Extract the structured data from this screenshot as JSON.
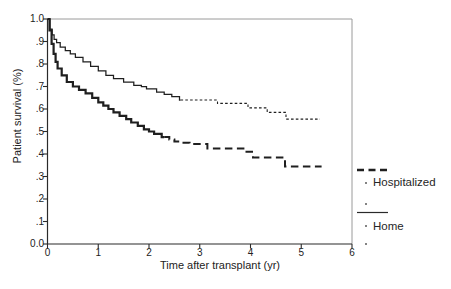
{
  "figure": {
    "background": "#ffffff",
    "ink_color": "#1f1f1f",
    "frame_color": "#9a9a9a",
    "axis_color": "#2a2a2a"
  },
  "chart_data": {
    "type": "line",
    "subtype": "kaplan-meier-step-survival",
    "title": "",
    "xlabel": "Time after transplant (yr)",
    "ylabel": "Patient survival (%)",
    "xlim": [
      0,
      6
    ],
    "ylim": [
      0,
      1
    ],
    "grid": false,
    "legend_position": "right-outside",
    "x_ticks": [
      0,
      1,
      2,
      3,
      4,
      5,
      6
    ],
    "x_tick_labels": [
      "0",
      "1",
      "2",
      "3",
      "4",
      "5",
      "6"
    ],
    "y_ticks": [
      1.0,
      0.9,
      0.8,
      0.7,
      0.6,
      0.5,
      0.4,
      0.3,
      0.2,
      0.1,
      0.0
    ],
    "y_tick_labels": [
      "1.0",
      ".9",
      ".8",
      ".7",
      ".6",
      ".5",
      ".4",
      ".3",
      ".2",
      ".1",
      "0.0"
    ],
    "series": [
      {
        "name": "Hospitalized",
        "line_style": "dashed",
        "points": [
          [
            0,
            1.0
          ],
          [
            0.04,
            0.95
          ],
          [
            0.08,
            0.89
          ],
          [
            0.12,
            0.845
          ],
          [
            0.16,
            0.81
          ],
          [
            0.2,
            0.78
          ],
          [
            0.28,
            0.75
          ],
          [
            0.38,
            0.72
          ],
          [
            0.5,
            0.7
          ],
          [
            0.62,
            0.685
          ],
          [
            0.75,
            0.67
          ],
          [
            0.88,
            0.65
          ],
          [
            1.0,
            0.63
          ],
          [
            1.1,
            0.615
          ],
          [
            1.2,
            0.6
          ],
          [
            1.3,
            0.585
          ],
          [
            1.42,
            0.57
          ],
          [
            1.55,
            0.555
          ],
          [
            1.65,
            0.54
          ],
          [
            1.78,
            0.525
          ],
          [
            1.9,
            0.51
          ],
          [
            2.0,
            0.5
          ],
          [
            2.1,
            0.49
          ],
          [
            2.25,
            0.475
          ],
          [
            2.4,
            0.465
          ],
          [
            2.5,
            0.455
          ],
          [
            2.65,
            0.45
          ],
          [
            2.8,
            0.444
          ],
          [
            3.15,
            0.425
          ],
          [
            3.9,
            0.41
          ],
          [
            4.05,
            0.385
          ],
          [
            4.68,
            0.345
          ],
          [
            5.4,
            0.345
          ]
        ]
      },
      {
        "name": "Home",
        "line_style": "solid",
        "points": [
          [
            0,
            1.0
          ],
          [
            0.05,
            0.955
          ],
          [
            0.09,
            0.93
          ],
          [
            0.13,
            0.91
          ],
          [
            0.18,
            0.895
          ],
          [
            0.25,
            0.875
          ],
          [
            0.35,
            0.86
          ],
          [
            0.45,
            0.845
          ],
          [
            0.55,
            0.83
          ],
          [
            0.7,
            0.81
          ],
          [
            0.85,
            0.79
          ],
          [
            1.0,
            0.77
          ],
          [
            1.15,
            0.75
          ],
          [
            1.3,
            0.735
          ],
          [
            1.5,
            0.72
          ],
          [
            1.7,
            0.705
          ],
          [
            1.85,
            0.7
          ],
          [
            1.95,
            0.69
          ],
          [
            2.15,
            0.675
          ],
          [
            2.3,
            0.665
          ],
          [
            2.45,
            0.655
          ],
          [
            2.6,
            0.64
          ],
          [
            3.35,
            0.625
          ],
          [
            3.95,
            0.605
          ],
          [
            4.33,
            0.585
          ],
          [
            4.7,
            0.555
          ],
          [
            5.37,
            0.555
          ]
        ]
      }
    ]
  },
  "legend": {
    "items": [
      {
        "label": "Hospitalized",
        "line_style": "dashed"
      },
      {
        "label": "Home",
        "line_style": "solid"
      }
    ]
  }
}
